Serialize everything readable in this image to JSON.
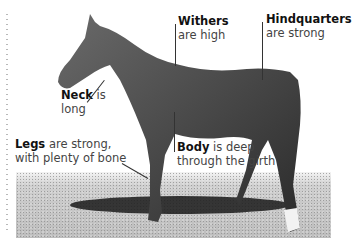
{
  "diagram": {
    "labels": [
      {
        "term": "Withers",
        "text": "are high"
      },
      {
        "term": "Hindquarters",
        "text": "are strong"
      },
      {
        "term": "Neck",
        "text_inline": "is",
        "text": "long"
      },
      {
        "term": "Legs",
        "text_inline": "are strong,",
        "text": "with plenty of bone"
      },
      {
        "term": "Body",
        "text_inline": "is deep",
        "text": "through the girth"
      }
    ]
  }
}
